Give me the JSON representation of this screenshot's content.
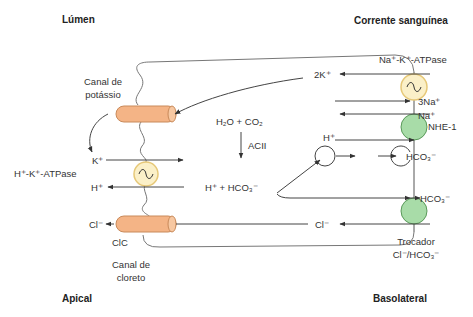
{
  "regions": {
    "lumen": "Lúmen",
    "blood": "Corrente sanguínea",
    "apical": "Apical",
    "basolateral": "Basolateral"
  },
  "labels": {
    "k_channel_line1": "Canal de",
    "k_channel_line2": "potássio",
    "hk_atpase": "H⁺-K⁺-ATPase",
    "k_ion": "K⁺",
    "h_ion_apical": "H⁺",
    "cl_ion_apical": "Cl⁻",
    "clc": "ClC",
    "cl_channel_line1": "Canal de",
    "cl_channel_line2": "cloreto",
    "reaction_top": "H₂O + CO₂",
    "enzyme": "ACII",
    "reaction_bottom": "H⁺ + HCO₃⁻",
    "nak_atpase": "Na⁺-K⁺-ATPase",
    "two_k": "2K⁺",
    "three_na": "3Na⁺",
    "na_ion": "Na⁺",
    "nhe1": "NHE-1",
    "h_ion_baso": "H⁺",
    "hco3_1": "HCO₃⁻",
    "hco3_2": "HCO₃⁻",
    "cl_ion_baso": "Cl⁻",
    "exchanger_line1": "Trocador",
    "exchanger_line2": "Cl⁻/HCO₃⁻"
  },
  "colors": {
    "channel_fill": "#f4b486",
    "channel_stroke": "#c98a5a",
    "atpase_fill": "#fbf0c8",
    "atpase_stroke": "#e6c878",
    "exchanger_fill": "#a8dca8",
    "exchanger_stroke": "#5a9a5a",
    "line": "#444444"
  }
}
